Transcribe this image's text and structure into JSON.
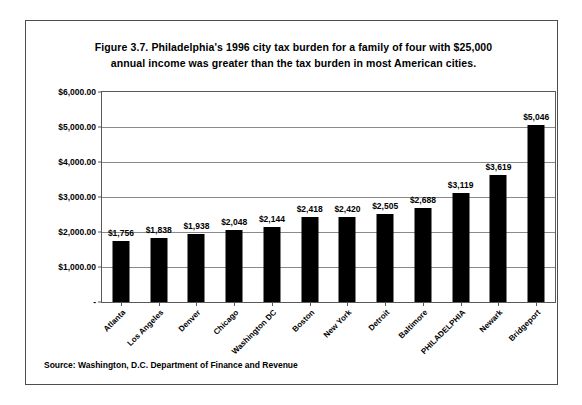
{
  "figure": {
    "title_line1": "Figure 3.7. Philadelphia's 1996 city tax burden for a family of four with $25,000",
    "title_line2": "annual income was greater than the tax burden in most American cities.",
    "source": "Source: Washington, D.C. Department of Finance and Revenue"
  },
  "chart_data": {
    "type": "bar",
    "title": "Figure 3.7. Philadelphia's 1996 city tax burden for a family of four with $25,000 annual income was greater than the tax burden in most American cities.",
    "xlabel": "",
    "ylabel": "",
    "ylim": [
      0,
      6000
    ],
    "ytick_values": [
      0,
      1000,
      2000,
      3000,
      4000,
      5000,
      6000
    ],
    "ytick_labels": [
      "-",
      "$1,000.00",
      "$2,000.00",
      "$3,000.00",
      "$4,000.00",
      "$5,000.00",
      "$6,000.00"
    ],
    "grid": "horizontal",
    "legend": "none",
    "bar_color": "#000000",
    "categories": [
      "Atlanta",
      "Los Angeles",
      "Denver",
      "Chicago",
      "Washington DC",
      "Boston",
      "New York",
      "Detroit",
      "Baltimore",
      "PHILADELPHIA",
      "Newark",
      "Bridgeport"
    ],
    "values": [
      1756,
      1838,
      1938,
      2048,
      2144,
      2418,
      2420,
      2505,
      2688,
      3119,
      3619,
      5046
    ],
    "data_labels": [
      "$1,756",
      "$1,838",
      "$1,938",
      "$2,048",
      "$2,144",
      "$2,418",
      "$2,420",
      "$2,505",
      "$2,688",
      "$3,119",
      "$3,619",
      "$5,046"
    ]
  }
}
